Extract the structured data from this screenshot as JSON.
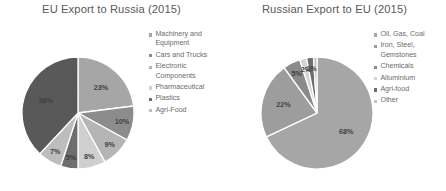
{
  "charts": [
    {
      "title": "EU Export to Russia (2015)",
      "legend": [
        {
          "label": "Machinery and Equipment",
          "color": "#a6a6a6"
        },
        {
          "label": "Cars and Trucks",
          "color": "#8c8c8c"
        },
        {
          "label": "Electronic Components",
          "color": "#b5b5b5"
        },
        {
          "label": "Pharmaceutical",
          "color": "#cfcfcf"
        },
        {
          "label": "Plastics",
          "color": "#6e6e6e"
        },
        {
          "label": "Agri-Food",
          "color": "#bdbdbd"
        }
      ]
    },
    {
      "title": "Russian Export to EU (2015)",
      "legend": [
        {
          "label": "Oil, Gas, Coal",
          "color": "#a6a6a6"
        },
        {
          "label": "Iron, Steel, Gemstones",
          "color": "#9d9d9d"
        },
        {
          "label": "Chemicals",
          "color": "#8a8a8a"
        },
        {
          "label": "Alluminium",
          "color": "#d4d4d4"
        },
        {
          "label": "Agri-food",
          "color": "#6e6e6e"
        },
        {
          "label": "Other",
          "color": "#c2c2c2"
        }
      ]
    }
  ],
  "chart_data": [
    {
      "type": "pie",
      "title": "EU Export to Russia (2015)",
      "categories": [
        "Machinery and Equipment",
        "Cars and Trucks",
        "Electronic Components",
        "Pharmaceutical",
        "Plastics",
        "Agri-Food",
        "Other"
      ],
      "values": [
        23,
        10,
        9,
        8,
        5,
        7,
        38
      ],
      "labels": [
        "23%",
        "10%",
        "9%",
        "8%",
        "5%",
        "7%",
        "38%"
      ],
      "colors": [
        "#a6a6a6",
        "#8c8c8c",
        "#b5b5b5",
        "#cfcfcf",
        "#6e6e6e",
        "#bdbdbd",
        "#595959"
      ],
      "label_colors": [
        "#3f3f3f",
        "#3f3f3f",
        "#3f3f3f",
        "#3f3f3f",
        "#ffffff",
        "#3f3f3f",
        "#ffffff"
      ],
      "unit": "%",
      "start_angle": 0,
      "direction": "clockwise",
      "legend_position": "right",
      "grid": false
    },
    {
      "type": "pie",
      "title": "Russian Export to EU (2015)",
      "categories": [
        "Oil, Gas, Coal",
        "Iron, Steel, Gemstones",
        "Chemicals",
        "Alluminium",
        "Agri-food",
        "Other"
      ],
      "values": [
        68,
        22,
        5,
        2,
        2,
        1
      ],
      "labels": [
        "68%",
        "22%",
        "5%",
        "2%",
        "2%",
        ""
      ],
      "colors": [
        "#a6a6a6",
        "#9d9d9d",
        "#8a8a8a",
        "#d4d4d4",
        "#6e6e6e",
        "#c2c2c2"
      ],
      "label_colors": [
        "#3f3f3f",
        "#3f3f3f",
        "#3f3f3f",
        "#3f3f3f",
        "#3f3f3f",
        "#3f3f3f"
      ],
      "unit": "%",
      "start_angle": 0,
      "direction": "clockwise",
      "legend_position": "right",
      "grid": false
    }
  ]
}
